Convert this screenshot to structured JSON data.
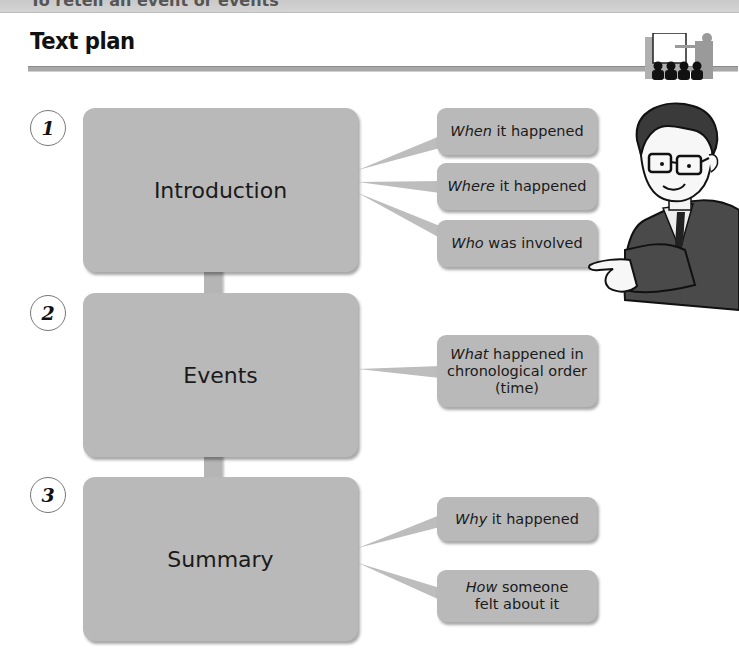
{
  "banner": {
    "text": "To retell an event or events"
  },
  "header": {
    "title": "Text plan",
    "icon": "presenter-audience-icon"
  },
  "colors": {
    "box_fill": "#b9b9b9",
    "connector": "#b5b5b5",
    "rule": "#a8a8a8",
    "text": "#1a1a1a"
  },
  "sections": [
    {
      "number": "1",
      "label": "Introduction",
      "callouts": [
        {
          "em": "When",
          "rest": " it happened"
        },
        {
          "em": "Where",
          "rest": " it happened"
        },
        {
          "em": "Who",
          "rest": " was involved"
        }
      ]
    },
    {
      "number": "2",
      "label": "Events",
      "callouts": [
        {
          "em": "What",
          "rest": " happened in chronological order (time)"
        }
      ]
    },
    {
      "number": "3",
      "label": "Summary",
      "callouts": [
        {
          "em": "Why",
          "rest": " it happened"
        },
        {
          "em": "How",
          "rest": " someone felt about it"
        }
      ]
    }
  ],
  "illustration": {
    "name": "teacher-pointing-illustration"
  }
}
